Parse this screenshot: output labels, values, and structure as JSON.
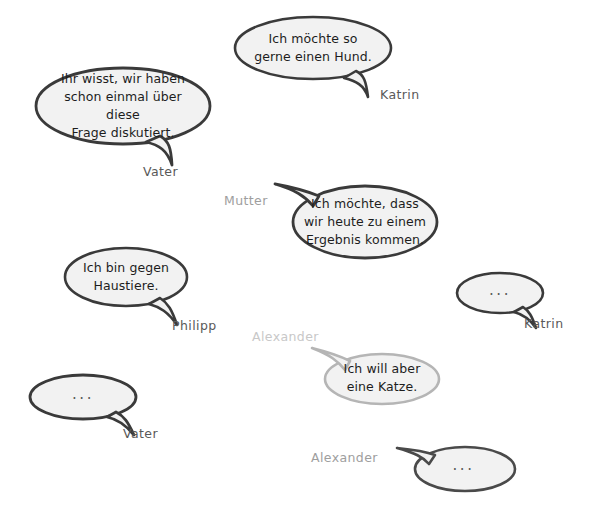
{
  "scene": {
    "title": "Sprechblasen-Dialog",
    "background_color": "#ffffff",
    "bubble_fill": "#f2f2f2",
    "stroke_dark": "#3a3a3a",
    "stroke_light": "#b5b5b5",
    "label_dark": "#595959",
    "label_light": "#c8c8c8",
    "empty_placeholder": "..."
  },
  "bubbles": [
    {
      "id": "katrin-hund",
      "speaker": "Katrin",
      "text": "Ich möchte so\ngerne einen Hund.",
      "empty": false,
      "tone": "dark"
    },
    {
      "id": "vater-frage",
      "speaker": "Vater",
      "text": "Ihr wisst, wir haben\nschon einmal über diese\nFrage diskutiert.",
      "empty": false,
      "tone": "dark"
    },
    {
      "id": "mutter-ergebnis",
      "speaker": "Mutter",
      "text": "Ich möchte, dass\nwir heute zu einem\nErgebnis kommen.",
      "empty": false,
      "tone": "dark"
    },
    {
      "id": "philipp-haustiere",
      "speaker": "Philipp",
      "text": "Ich bin gegen\nHaustiere.",
      "empty": false,
      "tone": "dark"
    },
    {
      "id": "katrin-empty",
      "speaker": "Katrin",
      "text": "...",
      "empty": true,
      "tone": "dark"
    },
    {
      "id": "alexander-katze",
      "speaker": "Alexander",
      "text": "Ich will aber\neine Katze.",
      "empty": false,
      "tone": "light"
    },
    {
      "id": "vater-empty",
      "speaker": "Vater",
      "text": "...",
      "empty": true,
      "tone": "dark"
    },
    {
      "id": "alexander-empty",
      "speaker": "Alexander",
      "text": "...",
      "empty": true,
      "tone": "dark"
    }
  ]
}
